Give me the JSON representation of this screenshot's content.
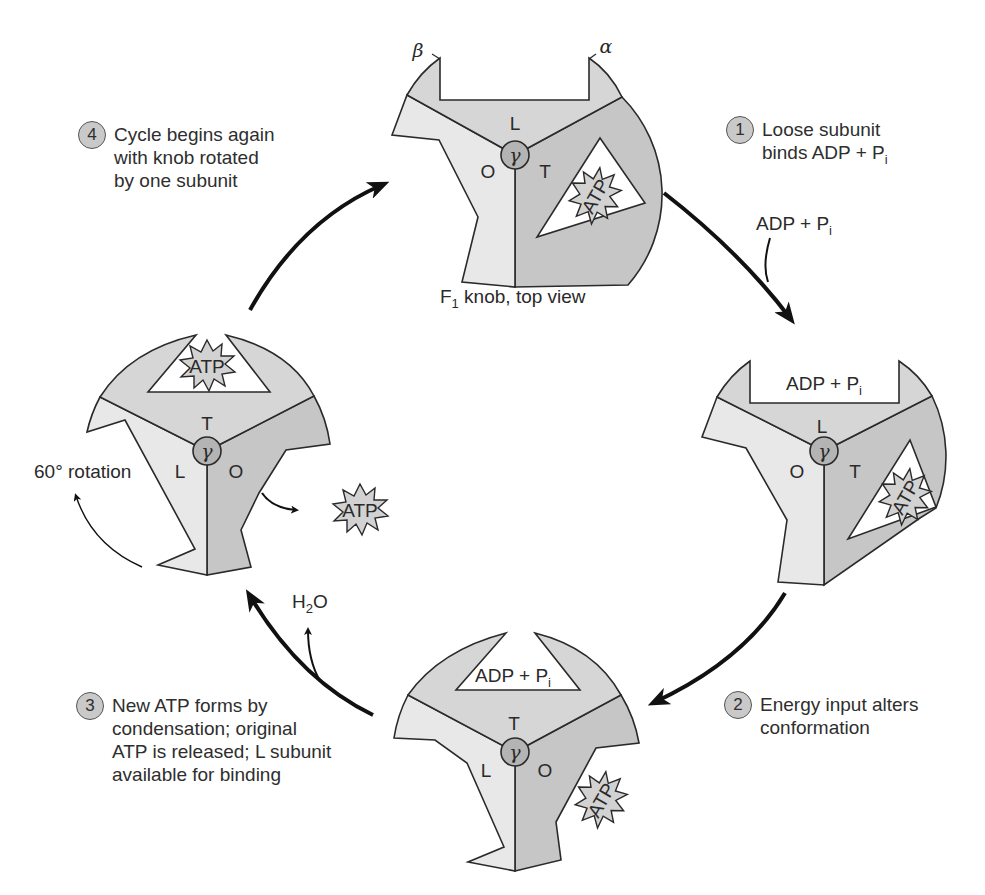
{
  "colors": {
    "loose_subunit": "#d6d6d6",
    "open_subunit": "#e8e8e8",
    "tight_subunit": "#c6c6c6",
    "gamma": "#b4b4b4",
    "step_badge": "#c9c9c9",
    "stroke": "#2a2a2a"
  },
  "steps": [
    {
      "number": "1",
      "text": "Loose subunit\nbinds ADP + P",
      "sub": "i"
    },
    {
      "number": "2",
      "text": "Energy input alters\nconformation"
    },
    {
      "number": "3",
      "text": "New ATP forms by\ncondensation; original\nATP is released; L subunit\navailable for binding"
    },
    {
      "number": "4",
      "text": "Cycle begins again\nwith knob rotated\nby one subunit"
    }
  ],
  "knobs": {
    "top": {
      "caption": "F",
      "caption_sub": "1",
      "caption_rest": " knob, top view",
      "beta_label": "β",
      "alpha_label": "α",
      "subunits": {
        "top": "L",
        "left": "O",
        "right": "T"
      },
      "gamma": "γ",
      "bound": "ATP"
    },
    "right": {
      "subunits": {
        "top": "L",
        "left": "O",
        "right": "T"
      },
      "gamma": "γ",
      "bound_site_label": "ADP + P",
      "bound_site_sub": "i",
      "bound": "ATP"
    },
    "bottom": {
      "subunits": {
        "top": "T",
        "left": "L",
        "right": "O"
      },
      "gamma": "γ",
      "bound_site_label": "ADP + P",
      "bound_site_sub": "i",
      "released": "ATP"
    },
    "left": {
      "subunits": {
        "top": "T",
        "left": "L",
        "right": "O"
      },
      "gamma": "γ",
      "bound": "ATP",
      "released": "ATP",
      "rotation_label": "60° rotation"
    }
  },
  "inputs": {
    "adp_pi": "ADP + P",
    "adp_pi_sub": "i",
    "water": "H",
    "water_sub": "2",
    "water_rest": "O"
  }
}
